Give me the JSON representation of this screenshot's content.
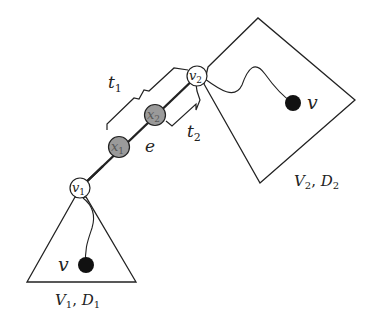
{
  "diagram": {
    "colors": {
      "stroke": "#222222",
      "gray_node": "#9a9a9a",
      "white_node": "#ffffff",
      "black_dot": "#111111"
    },
    "nodes": {
      "v1": {
        "base": "v",
        "sub": "1"
      },
      "v2": {
        "base": "v",
        "sub": "2"
      },
      "x1": {
        "base": "x",
        "sub": "1"
      },
      "x2": {
        "base": "x",
        "sub": "2"
      }
    },
    "edge_label": "e",
    "brace_labels": {
      "t1": {
        "base": "t",
        "sub": "1"
      },
      "t2": {
        "base": "t",
        "sub": "2"
      }
    },
    "regions": {
      "bottom": {
        "base1": "V",
        "sub1": "1",
        "sep": ", ",
        "base2": "D",
        "sub2": "1",
        "vertex_label": "v"
      },
      "top": {
        "base1": "V",
        "sub1": "2",
        "sep": ", ",
        "base2": "D",
        "sub2": "2",
        "vertex_label": "v"
      }
    }
  }
}
